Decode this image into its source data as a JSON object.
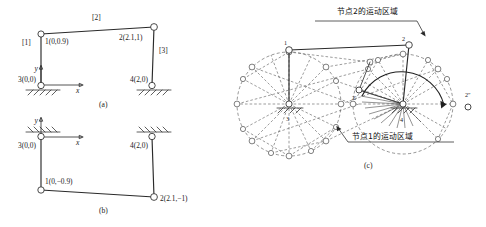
{
  "figure": {
    "title_implicit": "四杆机构节点运动区域示意图",
    "captions": [
      {
        "id": "a",
        "text": "(a)"
      },
      {
        "id": "b",
        "text": "(b)"
      },
      {
        "id": "c",
        "text": "(c)"
      }
    ]
  },
  "panel_a": {
    "caption": "(a)",
    "nodes": [
      {
        "id": "n1",
        "label": "1(0,0.9)",
        "x": 0,
        "y": 0.9
      },
      {
        "id": "n2",
        "label": "2(2.1,1)",
        "x": 2.1,
        "y": 1
      },
      {
        "id": "n3",
        "label": "3(0,0)",
        "x": 0,
        "y": 0
      },
      {
        "id": "n4",
        "label": "4(2,0)",
        "x": 2,
        "y": 0
      }
    ],
    "members": [
      {
        "id": "m1",
        "label": "[1]"
      },
      {
        "id": "m2",
        "label": "[2]"
      },
      {
        "id": "m3",
        "label": "[3]"
      }
    ],
    "axes": {
      "x": "x",
      "y": "y"
    },
    "supports": [
      "3",
      "4"
    ]
  },
  "panel_b": {
    "caption": "(b)",
    "nodes": [
      {
        "id": "n1",
        "label": "1(0,−0.9)",
        "x": 0,
        "y": -0.9
      },
      {
        "id": "n2",
        "label": "2(2.1,−1)",
        "x": 2.1,
        "y": -1
      },
      {
        "id": "n3",
        "label": "3(0,0)",
        "x": 0,
        "y": 0
      },
      {
        "id": "n4",
        "label": "4(2,0)",
        "x": 2,
        "y": 0
      }
    ],
    "axes": {
      "x": "x",
      "y": "y"
    },
    "supports": [
      "3",
      "4"
    ]
  },
  "panel_c": {
    "caption": "(c)",
    "annotations": [
      {
        "id": "node2_region",
        "text": "节点2的运动区域"
      },
      {
        "id": "node1_region",
        "text": "节点1的运动区域"
      }
    ],
    "node_labels": [
      {
        "id": "c1",
        "text": "1"
      },
      {
        "id": "c2",
        "text": "2"
      },
      {
        "id": "c2p",
        "text": "2′"
      },
      {
        "id": "c2pp",
        "text": "2″"
      },
      {
        "id": "c3",
        "text": "3"
      },
      {
        "id": "c4",
        "text": "4"
      }
    ],
    "supports": [
      "3",
      "4"
    ]
  },
  "colors": {
    "ink": "#1a1a1a",
    "solid_line": "#2a2a2a",
    "dashed_line": "#555555",
    "joint_fill": "#ffffff",
    "background": "#ffffff"
  }
}
